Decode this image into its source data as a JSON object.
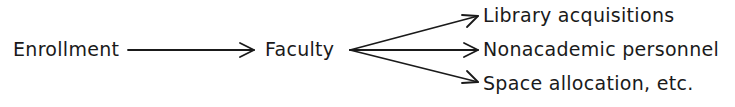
{
  "diagram": {
    "nodes": {
      "source": "Enrollment",
      "middle": "Faculty",
      "targets": [
        "Library acquisitions",
        "Nonacademic personnel",
        "Space allocation, etc."
      ]
    },
    "edges": [
      {
        "from": "Enrollment",
        "to": "Faculty"
      },
      {
        "from": "Faculty",
        "to": "Library acquisitions"
      },
      {
        "from": "Faculty",
        "to": "Nonacademic personnel"
      },
      {
        "from": "Faculty",
        "to": "Space allocation, etc."
      }
    ],
    "colors": {
      "ink": "#1a1a1a",
      "background": "#ffffff"
    }
  }
}
